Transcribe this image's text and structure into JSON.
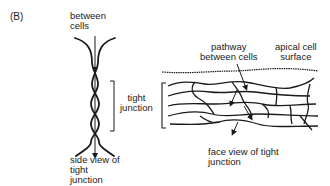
{
  "panel_label": "(B)",
  "side_view": {
    "top_label_line1": "between",
    "top_label_line2": "cells",
    "bracket_label_line1": "tight",
    "bracket_label_line2": "junction",
    "caption_line1": "side view of",
    "caption_line2": "tight",
    "caption_line3": "junction"
  },
  "face_view": {
    "pathway_label_line1": "pathway",
    "pathway_label_line2": "between cells",
    "apical_label_line1": "apical cell",
    "apical_label_line2": "surface",
    "caption_line1": "face view of tight",
    "caption_line2": "junction"
  },
  "colors": {
    "ink": "#1a1a1a",
    "background": "#ffffff"
  }
}
